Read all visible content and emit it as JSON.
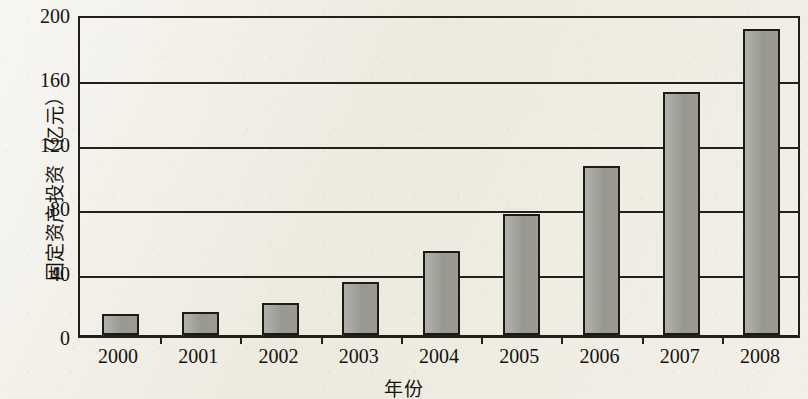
{
  "chart_data": {
    "type": "bar",
    "title": "",
    "xlabel": "年份",
    "ylabel": "固定资产投资（亿元）",
    "categories": [
      "2000",
      "2001",
      "2002",
      "2003",
      "2004",
      "2005",
      "2006",
      "2007",
      "2008"
    ],
    "values": [
      13,
      14,
      20,
      33,
      52,
      75,
      105,
      151,
      190
    ],
    "series": [
      {
        "name": "固定资产投资",
        "values": [
          13,
          14,
          20,
          33,
          52,
          75,
          105,
          151,
          190
        ]
      }
    ],
    "ylim": [
      0,
      200
    ],
    "y_ticks": [
      0,
      40,
      80,
      120,
      160,
      200
    ],
    "y_tick_labels": [
      "0",
      "40",
      "80",
      "120",
      "160",
      "200"
    ],
    "grid": "horizontal",
    "legend": "none",
    "bar_color": "#9e9e97",
    "bar_edge_color": "#1d1b17",
    "axis_color": "#24211c",
    "background_color": "#efece3"
  }
}
